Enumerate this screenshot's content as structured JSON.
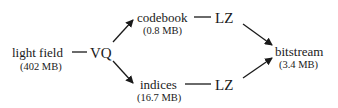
{
  "diagram": {
    "nodes": {
      "light_field": {
        "label": "light field",
        "size": "(402 MB)"
      },
      "vq": {
        "label": "VQ"
      },
      "codebook": {
        "label": "codebook",
        "size": "(0.8 MB)"
      },
      "indices": {
        "label": "indices",
        "size": "(16.7 MB)"
      },
      "lz_top": {
        "label": "LZ"
      },
      "lz_bottom": {
        "label": "LZ"
      },
      "bitstream": {
        "label": "bitstream",
        "size": "(3.4 MB)"
      }
    },
    "edges": [
      {
        "from": "light_field",
        "to": "vq",
        "style": "line"
      },
      {
        "from": "vq",
        "to": "codebook",
        "style": "arrow"
      },
      {
        "from": "vq",
        "to": "indices",
        "style": "arrow"
      },
      {
        "from": "codebook",
        "to": "lz_top",
        "style": "line"
      },
      {
        "from": "indices",
        "to": "lz_bottom",
        "style": "line"
      },
      {
        "from": "lz_top",
        "to": "bitstream",
        "style": "arrow"
      },
      {
        "from": "lz_bottom",
        "to": "bitstream",
        "style": "arrow"
      }
    ]
  }
}
